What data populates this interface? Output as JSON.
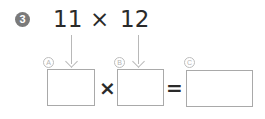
{
  "problem": {
    "number": "3",
    "expression": {
      "left": "11",
      "operator": "×",
      "right": "12"
    }
  },
  "equation": {
    "box_a_label": "A",
    "box_b_label": "B",
    "box_c_label": "C",
    "multiply_sign": "×",
    "equals_sign": "=",
    "box_a_value": "",
    "box_b_value": "",
    "box_c_value": ""
  },
  "colors": {
    "badge": "#7a7a7a",
    "text": "#2a2a2a",
    "guides": "#b8b8b8",
    "box_border": "#a9a9a9"
  }
}
